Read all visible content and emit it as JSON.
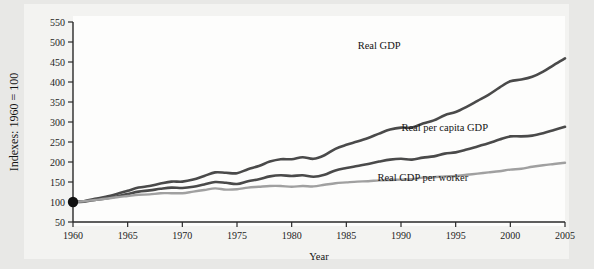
{
  "figure": {
    "background_color": "#e8e8e6",
    "plot_background_color": "#fdfdfc"
  },
  "chart_data": {
    "type": "line",
    "title": "",
    "xlabel": "Year",
    "ylabel": "Indexes: 1960 = 100",
    "xlim": [
      1960,
      2005
    ],
    "ylim": [
      50,
      550
    ],
    "ytick_step": 50,
    "xtick_step": 5,
    "grid": false,
    "legend_position": "inline-annotations",
    "xticks": [
      1960,
      1965,
      1970,
      1975,
      1980,
      1985,
      1990,
      1995,
      2000,
      2005
    ],
    "yticks": [
      50,
      100,
      150,
      200,
      250,
      300,
      350,
      400,
      450,
      500,
      550
    ],
    "x": [
      1960,
      1961,
      1962,
      1963,
      1964,
      1965,
      1966,
      1967,
      1968,
      1969,
      1970,
      1971,
      1972,
      1973,
      1974,
      1975,
      1976,
      1977,
      1978,
      1979,
      1980,
      1981,
      1982,
      1983,
      1984,
      1985,
      1986,
      1987,
      1988,
      1989,
      1990,
      1991,
      1992,
      1993,
      1994,
      1995,
      1996,
      1997,
      1998,
      1999,
      2000,
      2001,
      2002,
      2003,
      2004,
      2005
    ],
    "origin_marker": {
      "x": 1960,
      "y": 100,
      "color": "#111111"
    },
    "series": [
      {
        "name": "Real GDP",
        "label": "Real GDP",
        "color": "#4a4a4a",
        "width": 2.6,
        "label_x": 1988,
        "label_y": 482,
        "values": [
          100,
          102,
          108,
          113,
          120,
          128,
          136,
          140,
          146,
          151,
          151,
          156,
          165,
          174,
          173,
          172,
          182,
          190,
          201,
          207,
          207,
          212,
          208,
          217,
          233,
          243,
          251,
          260,
          271,
          281,
          286,
          286,
          296,
          304,
          317,
          325,
          338,
          353,
          368,
          386,
          402,
          406,
          413,
          426,
          443,
          459
        ]
      },
      {
        "name": "Real per capita GDP",
        "label": "Real per capita GDP",
        "color": "#4a4a4a",
        "width": 2.6,
        "label_x": 1994,
        "label_y": 278,
        "values": [
          100,
          101,
          105,
          109,
          114,
          120,
          126,
          129,
          133,
          136,
          135,
          138,
          144,
          150,
          148,
          145,
          152,
          157,
          164,
          167,
          165,
          167,
          163,
          168,
          179,
          185,
          190,
          195,
          201,
          206,
          208,
          206,
          211,
          214,
          221,
          224,
          231,
          239,
          247,
          256,
          264,
          264,
          266,
          272,
          280,
          288
        ]
      },
      {
        "name": "Real GDP per worker",
        "label": "Real GDP per worker",
        "color": "#a0a0a0",
        "width": 2.4,
        "label_x": 1992,
        "label_y": 152,
        "values": [
          100,
          102,
          105,
          108,
          112,
          115,
          118,
          119,
          122,
          122,
          122,
          126,
          130,
          134,
          131,
          132,
          136,
          138,
          140,
          140,
          138,
          140,
          139,
          143,
          147,
          149,
          151,
          152,
          154,
          155,
          156,
          157,
          161,
          162,
          164,
          165,
          168,
          171,
          174,
          177,
          181,
          183,
          188,
          192,
          195,
          198
        ]
      }
    ]
  }
}
